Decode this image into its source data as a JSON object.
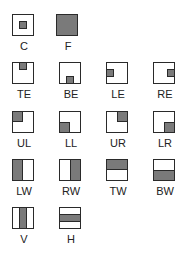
{
  "colors": {
    "fill": "#7a7a7a",
    "border": "#2a2a2a"
  },
  "items": [
    {
      "label": "C"
    },
    {
      "label": "F"
    },
    {
      "label": "TE"
    },
    {
      "label": "BE"
    },
    {
      "label": "LE"
    },
    {
      "label": "RE"
    },
    {
      "label": "UL"
    },
    {
      "label": "LL"
    },
    {
      "label": "UR"
    },
    {
      "label": "LR"
    },
    {
      "label": "LW"
    },
    {
      "label": "RW"
    },
    {
      "label": "TW"
    },
    {
      "label": "BW"
    },
    {
      "label": "V"
    },
    {
      "label": "H"
    }
  ]
}
